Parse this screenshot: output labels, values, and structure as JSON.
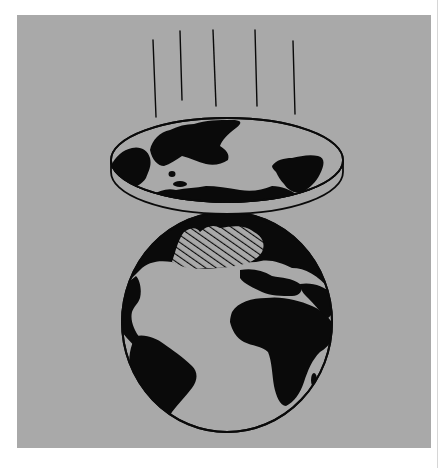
{
  "illustration": {
    "subject": "flat-earth-disc-above-globe",
    "colors": {
      "page_background": "#ffffff",
      "panel_background": "#a9a9a9",
      "ink": "#0a0a0a",
      "land_fill": "#0a0a0a",
      "edge_line": "#d6d6d6"
    },
    "motion_lines": [
      {
        "x1": 153,
        "y1": 40,
        "x2": 156,
        "y2": 117
      },
      {
        "x1": 180,
        "y1": 31,
        "x2": 182,
        "y2": 100
      },
      {
        "x1": 213,
        "y1": 30,
        "x2": 216,
        "y2": 106
      },
      {
        "x1": 255,
        "y1": 30,
        "x2": 257,
        "y2": 106
      },
      {
        "x1": 293,
        "y1": 41,
        "x2": 295,
        "y2": 114
      }
    ],
    "disc": {
      "cx": 227,
      "cy": 160,
      "rx": 116,
      "ry": 42,
      "rim_thickness": 12
    },
    "globe": {
      "cx": 227,
      "cy": 322,
      "rx": 105,
      "ry": 110
    },
    "hatched_region": "north-atlantic-greenland"
  }
}
